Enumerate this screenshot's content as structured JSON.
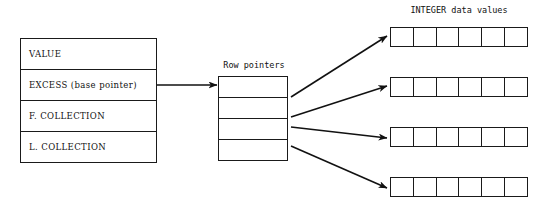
{
  "diagram": {
    "descriptor": {
      "name": "array-descriptor-block",
      "rows": [
        {
          "label": "VALUE"
        },
        {
          "label": "EXCESS  (base pointer)"
        },
        {
          "label": "F. COLLECTION"
        },
        {
          "label": "L. COLLECTION"
        }
      ]
    },
    "row_pointers": {
      "caption": "Row pointers",
      "cell_count": 4,
      "cells": [
        {
          "index": 0
        },
        {
          "index": 1
        },
        {
          "index": 2
        },
        {
          "index": 3
        }
      ]
    },
    "data_values": {
      "caption": "INTEGER data values",
      "row_count": 4,
      "cells_per_row": 6,
      "rows": [
        {
          "index": 0,
          "cells": [
            "",
            "",
            "",
            "",
            "",
            ""
          ]
        },
        {
          "index": 1,
          "cells": [
            "",
            "",
            "",
            "",
            "",
            ""
          ]
        },
        {
          "index": 2,
          "cells": [
            "",
            "",
            "",
            "",
            "",
            ""
          ]
        },
        {
          "index": 3,
          "cells": [
            "",
            "",
            "",
            "",
            "",
            ""
          ]
        }
      ]
    },
    "arrows": [
      {
        "name": "base-pointer-arrow",
        "from": "descriptor.EXCESS",
        "to": "row_pointers"
      },
      {
        "name": "row-pointer-arrow-0",
        "from": "row_pointers.cell.0",
        "to": "data_values.row.0"
      },
      {
        "name": "row-pointer-arrow-1",
        "from": "row_pointers.cell.1",
        "to": "data_values.row.1"
      },
      {
        "name": "row-pointer-arrow-2",
        "from": "row_pointers.cell.2",
        "to": "data_values.row.2"
      },
      {
        "name": "row-pointer-arrow-3",
        "from": "row_pointers.cell.3",
        "to": "data_values.row.3"
      }
    ],
    "colors": {
      "stroke": "#1a1a1a",
      "text": "#111111",
      "background": "#ffffff"
    }
  }
}
